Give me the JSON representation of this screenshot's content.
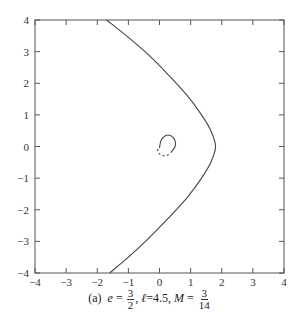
{
  "chart_data": {
    "type": "line",
    "title": "",
    "xlabel": "",
    "ylabel": "",
    "xlim": [
      -4,
      4
    ],
    "ylim": [
      -4,
      4
    ],
    "grid": false,
    "x_ticks": [
      -4,
      -3,
      -2,
      -1,
      0,
      1,
      2,
      3,
      4
    ],
    "y_ticks": [
      -4,
      -3,
      -2,
      -1,
      0,
      1,
      2,
      3,
      4
    ],
    "series": [
      {
        "name": "outer orbit",
        "style": "solid",
        "x": [
          -1.7,
          -1.0,
          -0.3,
          0.3,
          0.9,
          1.35,
          1.65,
          1.8,
          1.65,
          1.35,
          0.9,
          0.3,
          -0.4,
          -1.0,
          -1.6
        ],
        "y": [
          4.0,
          3.45,
          2.85,
          2.25,
          1.6,
          1.0,
          0.5,
          0.0,
          -0.5,
          -1.0,
          -1.6,
          -2.25,
          -2.95,
          -3.5,
          -4.0
        ]
      },
      {
        "name": "inner spiral (solid)",
        "style": "solid",
        "x": [
          0.0,
          0.05,
          0.2,
          0.38,
          0.5,
          0.5,
          0.4
        ],
        "y": [
          -0.05,
          0.2,
          0.35,
          0.33,
          0.18,
          0.0,
          -0.15
        ]
      },
      {
        "name": "inner spiral (dashed)",
        "style": "dashed",
        "x": [
          0.4,
          0.25,
          0.08,
          -0.05,
          -0.05
        ],
        "y": [
          -0.15,
          -0.28,
          -0.28,
          -0.18,
          -0.05
        ]
      }
    ],
    "caption": "(a) e = 3/2, ℓ = 4.5, M = 3/14"
  },
  "caption": {
    "prefix": "(a)",
    "e_label": "e",
    "e_num": "3",
    "e_den": "2",
    "l_label": "ℓ",
    "l_value": "4.5",
    "m_label": "M",
    "m_num": "3",
    "m_den": "14",
    "eq": "=",
    "sep": ","
  }
}
